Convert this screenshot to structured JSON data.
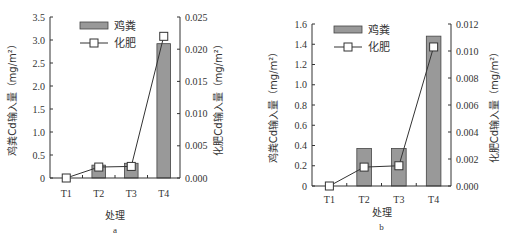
{
  "chart_data": [
    {
      "id": "a",
      "type": "bar",
      "panel_label": "a",
      "categories": [
        "T1",
        "T2",
        "T3",
        "T4"
      ],
      "xlabel": "处理",
      "ylabel": "鸡粪Cd输入量（mg/m²）",
      "ylabel_right": "化肥Cd输入量（mg/m²）",
      "ylim": [
        0,
        3.5
      ],
      "yticks": [
        "0",
        "0.5",
        "1.0",
        "1.5",
        "2.0",
        "2.5",
        "3.0",
        "3.5"
      ],
      "ylim_right": [
        0,
        0.025
      ],
      "yticks_right": [
        "0.000",
        "0.005",
        "0.010",
        "0.015",
        "0.020",
        "0.025"
      ],
      "series": [
        {
          "name": "鸡粪",
          "kind": "bar",
          "axis": "left",
          "color": "#999999",
          "values": [
            0,
            0.28,
            0.32,
            2.92
          ]
        },
        {
          "name": "化肥",
          "kind": "line",
          "axis": "right",
          "marker": "square-open",
          "values": [
            0.0,
            0.0017,
            0.0018,
            0.022
          ]
        }
      ],
      "legend": [
        "鸡粪",
        "化肥"
      ],
      "legend_position": "upper-left",
      "grid": false
    },
    {
      "id": "b",
      "type": "bar",
      "panel_label": "b",
      "categories": [
        "T1",
        "T2",
        "T3",
        "T4"
      ],
      "xlabel": "处理",
      "ylabel": "鸡粪Cd输入量（mg/m²）",
      "ylabel_right": "化肥Cd输入量（mg/m²）",
      "ylim": [
        0,
        1.6
      ],
      "yticks": [
        "0",
        "0.2",
        "0.4",
        "0.6",
        "0.8",
        "1.0",
        "1.2",
        "1.4",
        "1.6"
      ],
      "ylim_right": [
        0,
        0.012
      ],
      "yticks_right": [
        "0.000",
        "0.002",
        "0.004",
        "0.006",
        "0.008",
        "0.010",
        "0.012"
      ],
      "series": [
        {
          "name": "鸡粪",
          "kind": "bar",
          "axis": "left",
          "color": "#999999",
          "values": [
            0,
            0.37,
            0.37,
            1.48
          ]
        },
        {
          "name": "化肥",
          "kind": "line",
          "axis": "right",
          "marker": "square-open",
          "values": [
            0.0,
            0.0014,
            0.0015,
            0.0103
          ]
        }
      ],
      "legend": [
        "鸡粪",
        "化肥"
      ],
      "legend_position": "upper-left",
      "grid": false
    }
  ]
}
